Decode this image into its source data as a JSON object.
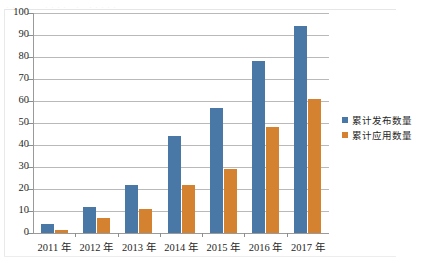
{
  "scan_artifact": {
    "top_bleed_text": "。。 。  ,  。。。。 。   。。。。。"
  },
  "legend": {
    "position": "right",
    "items": [
      {
        "label": "累计发布数量",
        "color": "#4a78a6",
        "icon": "square-swatch"
      },
      {
        "label": "累计应用数量",
        "color": "#d4822f",
        "icon": "square-swatch"
      }
    ]
  },
  "axes": {
    "y_ticks": [
      "0",
      "10",
      "20",
      "30",
      "40",
      "50",
      "60",
      "70",
      "80",
      "90",
      "100"
    ],
    "x_ticks": [
      "2011 年",
      "2012 年",
      "2013 年",
      "2014 年",
      "2015 年",
      "2016 年",
      "2017 年"
    ]
  },
  "chart_data": {
    "type": "bar",
    "title": "",
    "subtitle": "",
    "xlabel": "",
    "ylabel": "",
    "categories": [
      "2011 年",
      "2012 年",
      "2013 年",
      "2014 年",
      "2015 年",
      "2016 年",
      "2017 年"
    ],
    "series": [
      {
        "name": "累计发布数量",
        "color": "#4a78a6",
        "values": [
          4,
          12,
          22,
          44,
          57,
          78,
          94
        ]
      },
      {
        "name": "累计应用数量",
        "color": "#d4822f",
        "values": [
          1.5,
          7,
          11,
          22,
          29,
          48,
          61
        ]
      }
    ],
    "ylim": [
      0,
      100
    ],
    "ytick_step": 10,
    "grid": "horizontal-only",
    "legend_position": "right",
    "data_labels": false
  }
}
